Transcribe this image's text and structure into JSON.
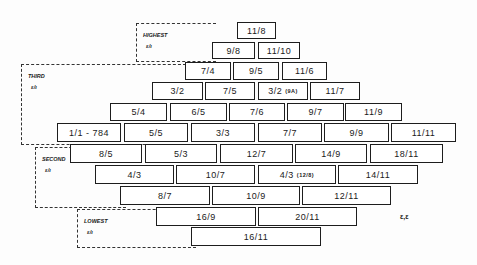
{
  "groups": [
    {
      "id": "highest",
      "name": "HIGHEST",
      "sub": "ε/ι",
      "x": 136,
      "y": 23,
      "w": 80,
      "h": 39
    },
    {
      "id": "third",
      "name": "THIRD",
      "sub": "ε/ι",
      "x": 21,
      "y": 64,
      "w": 165,
      "h": 81
    },
    {
      "id": "second",
      "name": "SECOND",
      "sub": "ε/ι",
      "x": 35,
      "y": 147,
      "w": 91,
      "h": 61
    },
    {
      "id": "lowest",
      "name": "LOWEST",
      "sub": "ε/ι",
      "x": 77,
      "y": 209,
      "w": 119,
      "h": 39
    }
  ],
  "boxes": [
    {
      "label": "11/8",
      "note": "",
      "x": 237,
      "y": 22,
      "w": 39,
      "h": 17
    },
    {
      "label": "9/8",
      "note": "",
      "x": 212,
      "y": 42,
      "w": 43,
      "h": 17
    },
    {
      "label": "11/10",
      "note": "",
      "x": 258,
      "y": 42,
      "w": 42,
      "h": 17
    },
    {
      "label": "7/4",
      "note": "",
      "x": 185,
      "y": 62,
      "w": 46,
      "h": 18
    },
    {
      "label": "9/5",
      "note": "",
      "x": 233,
      "y": 62,
      "w": 46,
      "h": 18
    },
    {
      "label": "11/6",
      "note": "",
      "x": 282,
      "y": 62,
      "w": 45,
      "h": 18
    },
    {
      "label": "3/2",
      "note": "",
      "x": 152,
      "y": 82,
      "w": 51,
      "h": 18
    },
    {
      "label": "7/5",
      "note": "",
      "x": 205,
      "y": 82,
      "w": 50,
      "h": 18
    },
    {
      "label": "3/2",
      "note": "(9A)",
      "x": 258,
      "y": 82,
      "w": 50,
      "h": 18
    },
    {
      "label": "11/7",
      "note": "",
      "x": 310,
      "y": 82,
      "w": 50,
      "h": 18
    },
    {
      "label": "5/4",
      "note": "",
      "x": 110,
      "y": 103,
      "w": 57,
      "h": 18
    },
    {
      "label": "6/5",
      "note": "",
      "x": 170,
      "y": 103,
      "w": 57,
      "h": 18
    },
    {
      "label": "7/6",
      "note": "",
      "x": 229,
      "y": 103,
      "w": 56,
      "h": 18
    },
    {
      "label": "9/7",
      "note": "",
      "x": 287,
      "y": 103,
      "w": 57,
      "h": 18
    },
    {
      "label": "11/9",
      "note": "",
      "x": 345,
      "y": 103,
      "w": 57,
      "h": 18
    },
    {
      "label": "1/1 - 784",
      "note": "",
      "x": 57,
      "y": 123,
      "w": 64,
      "h": 19
    },
    {
      "label": "5/5",
      "note": "",
      "x": 124,
      "y": 123,
      "w": 64,
      "h": 19
    },
    {
      "label": "3/3",
      "note": "",
      "x": 191,
      "y": 123,
      "w": 64,
      "h": 19
    },
    {
      "label": "7/7",
      "note": "",
      "x": 258,
      "y": 123,
      "w": 64,
      "h": 19
    },
    {
      "label": "9/9",
      "note": "",
      "x": 324,
      "y": 123,
      "w": 65,
      "h": 19
    },
    {
      "label": "11/11",
      "note": "",
      "x": 391,
      "y": 123,
      "w": 65,
      "h": 19
    },
    {
      "label": "8/5",
      "note": "",
      "x": 70,
      "y": 144,
      "w": 72,
      "h": 19
    },
    {
      "label": "5/3",
      "note": "",
      "x": 145,
      "y": 144,
      "w": 72,
      "h": 19
    },
    {
      "label": "12/7",
      "note": "",
      "x": 220,
      "y": 144,
      "w": 73,
      "h": 19
    },
    {
      "label": "14/9",
      "note": "",
      "x": 295,
      "y": 144,
      "w": 72,
      "h": 19
    },
    {
      "label": "18/11",
      "note": "",
      "x": 370,
      "y": 144,
      "w": 73,
      "h": 19
    },
    {
      "label": "4/3",
      "note": "",
      "x": 95,
      "y": 165,
      "w": 79,
      "h": 19
    },
    {
      "label": "10/7",
      "note": "",
      "x": 176,
      "y": 165,
      "w": 79,
      "h": 19
    },
    {
      "label": "4/3",
      "note": "(12/8)",
      "x": 258,
      "y": 165,
      "w": 78,
      "h": 19
    },
    {
      "label": "14/11",
      "note": "",
      "x": 338,
      "y": 165,
      "w": 80,
      "h": 19
    },
    {
      "label": "8/7",
      "note": "",
      "x": 120,
      "y": 186,
      "w": 90,
      "h": 19
    },
    {
      "label": "10/9",
      "note": "",
      "x": 212,
      "y": 186,
      "w": 88,
      "h": 19
    },
    {
      "label": "12/11",
      "note": "",
      "x": 302,
      "y": 186,
      "w": 89,
      "h": 19
    },
    {
      "label": "16/9",
      "note": "",
      "x": 156,
      "y": 207,
      "w": 100,
      "h": 19
    },
    {
      "label": "20/11",
      "note": "",
      "x": 258,
      "y": 207,
      "w": 99,
      "h": 19
    },
    {
      "label": "16/11",
      "note": "",
      "x": 191,
      "y": 227,
      "w": 130,
      "h": 19
    }
  ],
  "mark": {
    "text": "ε,ε",
    "x": 400,
    "y": 213
  }
}
